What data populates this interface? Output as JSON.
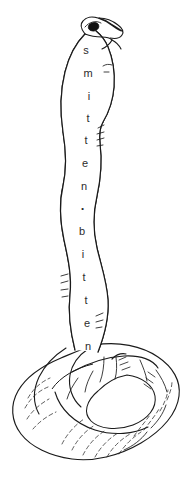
{
  "artwork": {
    "title": "smitten bitten",
    "subject": "coiled-cobra-line-drawing",
    "style": "black-ink-line-art",
    "background_color": "#ffffff",
    "ink_color": "#1a1a1a",
    "text_color": "#2b2b2b",
    "canvas": {
      "width": 187,
      "height": 483
    }
  },
  "body_text": {
    "full_string": "smitten·bitten",
    "orientation": "vertical-top-to-bottom",
    "glyphs": [
      {
        "char": "s",
        "x": 86,
        "y": 50
      },
      {
        "char": "m",
        "x": 88,
        "y": 73
      },
      {
        "char": "i",
        "x": 89,
        "y": 96
      },
      {
        "char": "t",
        "x": 88,
        "y": 118
      },
      {
        "char": "t",
        "x": 86,
        "y": 140
      },
      {
        "char": "e",
        "x": 85,
        "y": 163
      },
      {
        "char": "n",
        "x": 84,
        "y": 186
      },
      {
        "char": "·",
        "x": 83,
        "y": 208
      },
      {
        "char": "b",
        "x": 82,
        "y": 231
      },
      {
        "char": "i",
        "x": 83,
        "y": 254
      },
      {
        "char": "t",
        "x": 84,
        "y": 277
      },
      {
        "char": "t",
        "x": 86,
        "y": 300
      },
      {
        "char": "e",
        "x": 87,
        "y": 323
      },
      {
        "char": "n",
        "x": 88,
        "y": 346
      }
    ]
  },
  "figure_parts": {
    "head": "snake-head-with-eye",
    "eye": "dark-filled-almond-eye",
    "nostril": "small-curved-mark",
    "hood": "flared-cobra-hood",
    "neck": "vertical-raised-body",
    "coil": "torus-shaped-coiled-base",
    "coil_opening": "inner-ellipse-void",
    "scales": "dashed-and-hatched-scale-texture"
  }
}
